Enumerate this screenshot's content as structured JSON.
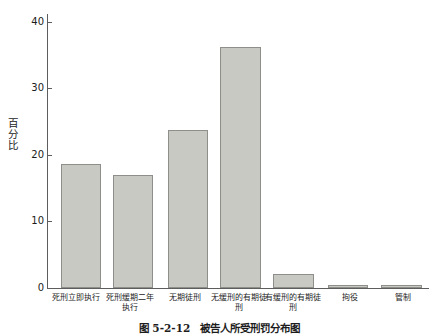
{
  "chart_data": {
    "type": "bar",
    "title": "",
    "xlabel": "",
    "ylabel": "百分比",
    "ylim": [
      0,
      42
    ],
    "yticks": [
      0,
      10,
      20,
      30,
      40
    ],
    "ytick_labels": [
      "0",
      "10",
      "20",
      "30",
      "40"
    ],
    "grid": false,
    "legend": null,
    "categories": [
      "死刑立即执行",
      "死刑缓期二年执行",
      "无期徒刑",
      "无缓刑的有期徒刑",
      "有缓刑的有期徒刑",
      "拘役",
      "管制"
    ],
    "values": [
      19.0,
      17.3,
      24.2,
      36.9,
      2.1,
      0.4,
      0.4
    ]
  },
  "axis": {
    "y_title": "百分比",
    "tick_labels": [
      "40",
      "30",
      "20",
      "10",
      "0"
    ]
  },
  "caption": {
    "text": "图 5-2-12　被告人所受刑罚分布图"
  },
  "colors": {
    "bar_fill": "#c9c9c4",
    "bar_stroke": "#8e8e8a",
    "axis": "#5d5d5d",
    "text": "#1c1c1c",
    "background": "#ffffff"
  }
}
